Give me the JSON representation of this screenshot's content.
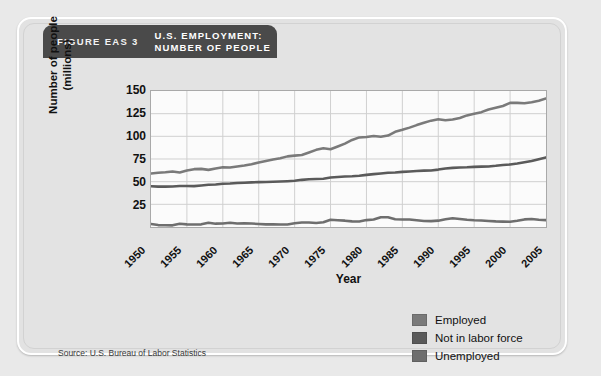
{
  "figure": {
    "number_label": "FIGURE EAS 3",
    "title": "U.S. EMPLOYMENT:\nNUMBER OF PEOPLE",
    "source": "Source: U.S. Bureau of Labor Statistics"
  },
  "legend": {
    "position": "bottom-right",
    "items": [
      {
        "label": "Employed",
        "color": "#7a7a7a"
      },
      {
        "label": "Not in labor force",
        "color": "#5a5a5a"
      },
      {
        "label": "Unemployed",
        "color": "#6e6e6e"
      }
    ]
  },
  "chart_data": {
    "type": "line",
    "title": "U.S. EMPLOYMENT: NUMBER OF PEOPLE",
    "xlabel": "Year",
    "ylabel": "Number of people\n(millions)",
    "xlim": [
      1950,
      2005
    ],
    "ylim": [
      0,
      150
    ],
    "yticks": [
      25,
      50,
      75,
      100,
      125,
      150
    ],
    "xticks": [
      1950,
      1955,
      1960,
      1965,
      1970,
      1975,
      1980,
      1985,
      1990,
      1995,
      2000,
      2005
    ],
    "grid": true,
    "legend_position": "bottom-right",
    "x": [
      1950,
      1951,
      1952,
      1953,
      1954,
      1955,
      1956,
      1957,
      1958,
      1959,
      1960,
      1961,
      1962,
      1963,
      1964,
      1965,
      1966,
      1967,
      1968,
      1969,
      1970,
      1971,
      1972,
      1973,
      1974,
      1975,
      1976,
      1977,
      1978,
      1979,
      1980,
      1981,
      1982,
      1983,
      1984,
      1985,
      1986,
      1987,
      1988,
      1989,
      1990,
      1991,
      1992,
      1993,
      1994,
      1995,
      1996,
      1997,
      1998,
      1999,
      2000,
      2001,
      2002,
      2003,
      2004,
      2005
    ],
    "series": [
      {
        "name": "Employed",
        "color": "#7a7a7a",
        "values": [
          58.9,
          59.9,
          60.3,
          61.2,
          60.1,
          62.2,
          63.8,
          64.1,
          63.0,
          64.6,
          65.8,
          65.7,
          66.7,
          67.8,
          69.3,
          71.1,
          72.9,
          74.4,
          75.9,
          77.9,
          78.7,
          79.4,
          82.2,
          85.1,
          86.8,
          85.8,
          88.8,
          92.0,
          96.0,
          98.8,
          99.3,
          100.4,
          99.5,
          100.8,
          105.0,
          107.2,
          109.6,
          112.4,
          115.0,
          117.3,
          118.8,
          117.7,
          118.5,
          120.3,
          123.1,
          124.9,
          126.7,
          129.6,
          131.5,
          133.5,
          136.9,
          136.9,
          136.5,
          137.7,
          139.3,
          141.7
        ]
      },
      {
        "name": "Not in labor force",
        "color": "#5a5a5a",
        "values": [
          45.0,
          44.5,
          44.5,
          44.6,
          45.2,
          45.3,
          45.1,
          45.8,
          46.5,
          46.8,
          47.6,
          47.9,
          48.5,
          48.9,
          49.2,
          49.5,
          49.6,
          49.8,
          50.1,
          50.5,
          51.0,
          52.0,
          52.6,
          52.9,
          53.3,
          54.5,
          55.2,
          55.7,
          56.0,
          56.5,
          57.5,
          58.3,
          59.0,
          59.8,
          60.2,
          60.8,
          61.2,
          61.7,
          62.2,
          62.4,
          63.3,
          64.6,
          65.2,
          65.7,
          65.8,
          66.3,
          66.6,
          66.8,
          67.5,
          68.4,
          69.0,
          70.0,
          71.4,
          72.7,
          74.7,
          76.8
        ]
      },
      {
        "name": "Unemployed",
        "color": "#6e6e6e",
        "values": [
          3.3,
          2.1,
          1.9,
          1.8,
          3.5,
          2.9,
          2.8,
          2.9,
          4.6,
          3.7,
          3.9,
          4.7,
          3.9,
          4.1,
          3.8,
          3.4,
          2.9,
          3.0,
          2.8,
          2.8,
          4.1,
          5.0,
          4.9,
          4.4,
          5.2,
          7.9,
          7.4,
          7.0,
          6.2,
          6.1,
          7.6,
          8.3,
          10.7,
          10.7,
          8.5,
          8.3,
          8.2,
          7.4,
          6.7,
          6.5,
          7.0,
          8.6,
          9.6,
          8.9,
          8.0,
          7.4,
          7.2,
          6.7,
          6.2,
          5.9,
          5.7,
          6.8,
          8.4,
          8.8,
          8.1,
          7.6
        ]
      }
    ]
  }
}
